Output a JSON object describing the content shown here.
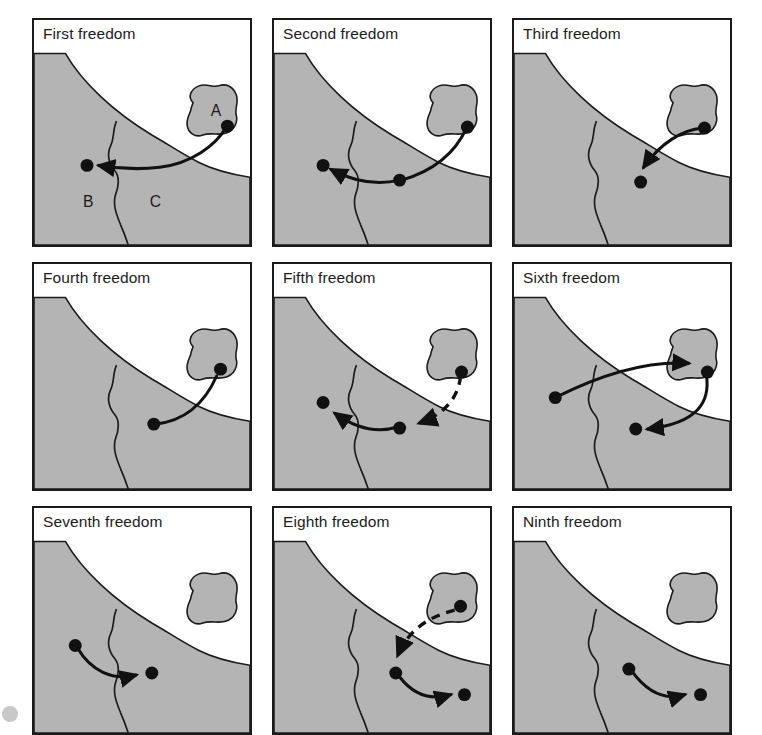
{
  "figure": {
    "columns": 3,
    "rows": 3,
    "colors": {
      "land_fill": "#b4b4b4",
      "land_stroke": "#1a1a1a",
      "water_fill": "#ffffff",
      "route_stroke": "#111111",
      "airport_dot": "#111111",
      "panel_border": "#1a1a1a",
      "title_text": "#1c1c1c",
      "page_background": "#ffffff"
    },
    "map_labels": {
      "country_a": "A",
      "country_b": "B",
      "country_c": "C",
      "note": "A is the island state (home country); B and C are adjacent states on the mainland separated by a border"
    },
    "legend": {
      "solid_line": "traffic-carrying flight sector",
      "dashed_line": "positioning / non-traffic sector",
      "dot": "airport"
    }
  },
  "panels": [
    {
      "id": "first-freedom",
      "index": 1,
      "title": "First freedom",
      "shows_labels": true,
      "route": "A to B overflying C",
      "segments": [
        {
          "from": "A",
          "to": "B",
          "style": "solid",
          "arrow": true
        }
      ]
    },
    {
      "id": "second-freedom",
      "index": 2,
      "title": "Second freedom",
      "shows_labels": false,
      "route": "A to B with technical stop in C",
      "segments": [
        {
          "from": "A",
          "to": "C",
          "style": "solid",
          "arrow": false
        },
        {
          "from": "C",
          "to": "B",
          "style": "solid",
          "arrow": true
        }
      ]
    },
    {
      "id": "third-freedom",
      "index": 3,
      "title": "Third freedom",
      "shows_labels": false,
      "route": "A to C",
      "segments": [
        {
          "from": "A",
          "to": "C",
          "style": "solid",
          "arrow": true
        }
      ]
    },
    {
      "id": "fourth-freedom",
      "index": 4,
      "title": "Fourth freedom",
      "shows_labels": false,
      "route": "C to A",
      "segments": [
        {
          "from": "C",
          "to": "A",
          "style": "solid",
          "arrow": false
        }
      ]
    },
    {
      "id": "fifth-freedom",
      "index": 5,
      "title": "Fifth freedom",
      "shows_labels": false,
      "route": "A to C positioning, then C to B carrying traffic",
      "segments": [
        {
          "from": "A",
          "to": "C",
          "style": "dashed",
          "arrow": true
        },
        {
          "from": "C",
          "to": "B",
          "style": "solid",
          "arrow": true
        }
      ]
    },
    {
      "id": "sixth-freedom",
      "index": 6,
      "title": "Sixth freedom",
      "shows_labels": false,
      "route": "B to A then A to C via home country",
      "segments": [
        {
          "from": "B",
          "to": "A",
          "style": "solid",
          "arrow": true
        },
        {
          "from": "A",
          "to": "C",
          "style": "solid",
          "arrow": true
        }
      ]
    },
    {
      "id": "seventh-freedom",
      "index": 7,
      "title": "Seventh freedom",
      "shows_labels": false,
      "route": "B to C standalone, no link to A",
      "segments": [
        {
          "from": "B",
          "to": "C",
          "style": "solid",
          "arrow": true
        }
      ]
    },
    {
      "id": "eighth-freedom",
      "index": 8,
      "title": "Eighth freedom",
      "shows_labels": false,
      "route": "A to C positioning, then cabotage within C",
      "segments": [
        {
          "from": "A",
          "to": "C1",
          "style": "dashed",
          "arrow": true
        },
        {
          "from": "C1",
          "to": "C2",
          "style": "solid",
          "arrow": true
        }
      ]
    },
    {
      "id": "ninth-freedom",
      "index": 9,
      "title": "Ninth freedom",
      "shows_labels": false,
      "route": "standalone cabotage within C",
      "segments": [
        {
          "from": "C1",
          "to": "C2",
          "style": "solid",
          "arrow": true
        }
      ]
    }
  ]
}
